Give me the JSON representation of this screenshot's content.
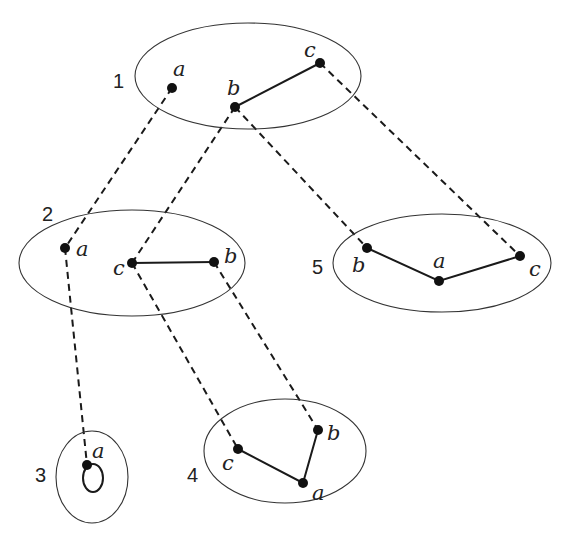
{
  "diagram": {
    "graphs": [
      {
        "id": "1",
        "label": "1",
        "vertices": [
          "a",
          "b",
          "c"
        ],
        "edges": [
          [
            "b",
            "c"
          ]
        ]
      },
      {
        "id": "2",
        "label": "2",
        "vertices": [
          "a",
          "c",
          "b"
        ],
        "edges": [
          [
            "c",
            "b"
          ]
        ]
      },
      {
        "id": "3",
        "label": "3",
        "vertices": [
          "a"
        ],
        "edges": [
          [
            "a",
            "a"
          ]
        ]
      },
      {
        "id": "4",
        "label": "4",
        "vertices": [
          "c",
          "b",
          "a"
        ],
        "edges": [
          [
            "c",
            "a"
          ],
          [
            "a",
            "b"
          ]
        ]
      },
      {
        "id": "5",
        "label": "5",
        "vertices": [
          "b",
          "a",
          "c"
        ],
        "edges": [
          [
            "b",
            "a"
          ],
          [
            "a",
            "c"
          ]
        ]
      }
    ],
    "mappings": [
      {
        "from": "1.a",
        "to": "2.a"
      },
      {
        "from": "1.b",
        "to": "2.c"
      },
      {
        "from": "1.b",
        "to": "5.b"
      },
      {
        "from": "1.c",
        "to": "5.c"
      },
      {
        "from": "2.a",
        "to": "3.a"
      },
      {
        "from": "2.c",
        "to": "4.c"
      },
      {
        "from": "2.b",
        "to": "4.b"
      }
    ],
    "labels": {
      "g1": "1",
      "g2": "2",
      "g3": "3",
      "g4": "4",
      "g5": "5",
      "g1_a": "a",
      "g1_b": "b",
      "g1_c": "c",
      "g2_a": "a",
      "g2_c": "c",
      "g2_b": "b",
      "g3_a": "a",
      "g4_c": "c",
      "g4_b": "b",
      "g4_a": "a",
      "g5_b": "b",
      "g5_a": "a",
      "g5_c": "c"
    }
  }
}
